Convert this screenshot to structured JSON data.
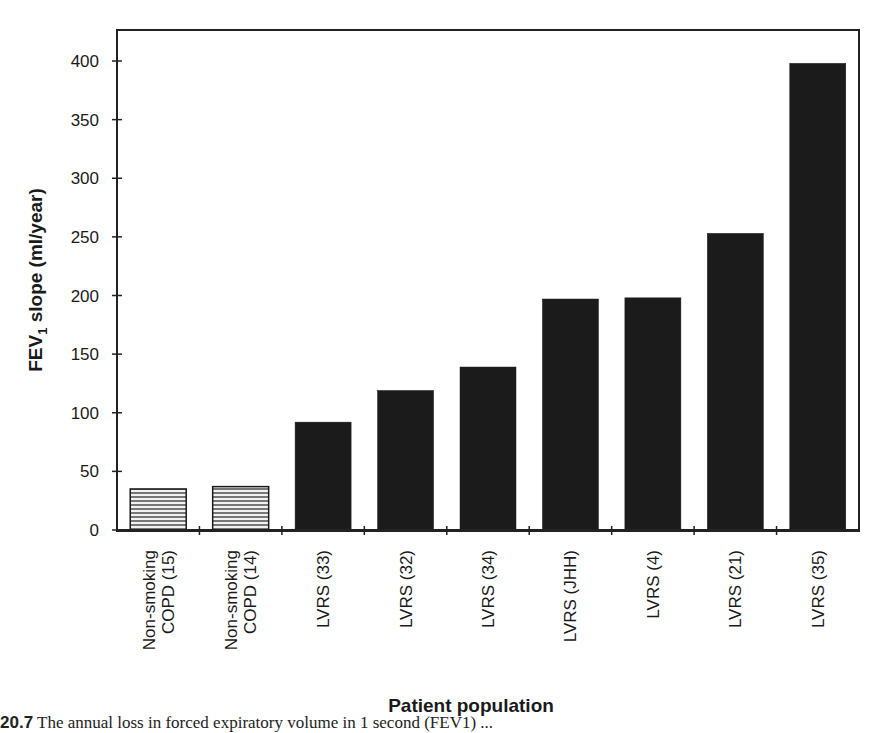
{
  "chart_data": {
    "type": "bar",
    "title": "",
    "xlabel": "Patient population",
    "ylabel": "FEV1 slope (ml/year)",
    "ylabel_main": "FEV",
    "ylabel_sub": "1",
    "ylabel_rest": " slope (ml/year)",
    "ylim": [
      0,
      420
    ],
    "yticks": [
      0,
      50,
      100,
      150,
      200,
      250,
      300,
      350,
      400
    ],
    "grid": false,
    "legend": null,
    "categories": [
      [
        "Non-smoking",
        "COPD (15)"
      ],
      [
        "Non-smoking",
        "COPD (14)"
      ],
      [
        "LVRS (33)"
      ],
      [
        "LVRS (32)"
      ],
      [
        "LVRS (34)"
      ],
      [
        "LVRS (JHH)"
      ],
      [
        "LVRS (4)"
      ],
      [
        "LVRS (21)"
      ],
      [
        "LVRS (35)"
      ]
    ],
    "values": [
      35,
      37,
      92,
      119,
      139,
      197,
      198,
      253,
      398
    ],
    "bar_styles": [
      "hatched",
      "hatched",
      "solid",
      "solid",
      "solid",
      "solid",
      "solid",
      "solid",
      "solid"
    ]
  },
  "caption": {
    "label": "20.7",
    "text": " The annual loss in forced expiratory volume in 1 second (FEV1) ..."
  },
  "colors": {
    "bar_fill": "#1b1b1b",
    "hatch_bg": "#f2f2f2",
    "hatch_line": "#333333",
    "axis": "#222222",
    "text": "#1a1a1a"
  }
}
